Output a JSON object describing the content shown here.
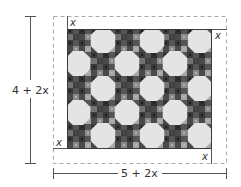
{
  "diagram": {
    "height_label": "4 + 2x",
    "width_label": "5 + 2x",
    "border_labels": [
      "x",
      "x",
      "x",
      "x"
    ],
    "quilt": {
      "inner_width_expr": "5",
      "inner_height_expr": "4",
      "pattern": "octagon patchwork"
    },
    "colors": {
      "line": "#555555",
      "dashed": "#aaaaaa",
      "octagon": "#e6e6e6",
      "quilt_bg": "#5a5a5a"
    }
  }
}
